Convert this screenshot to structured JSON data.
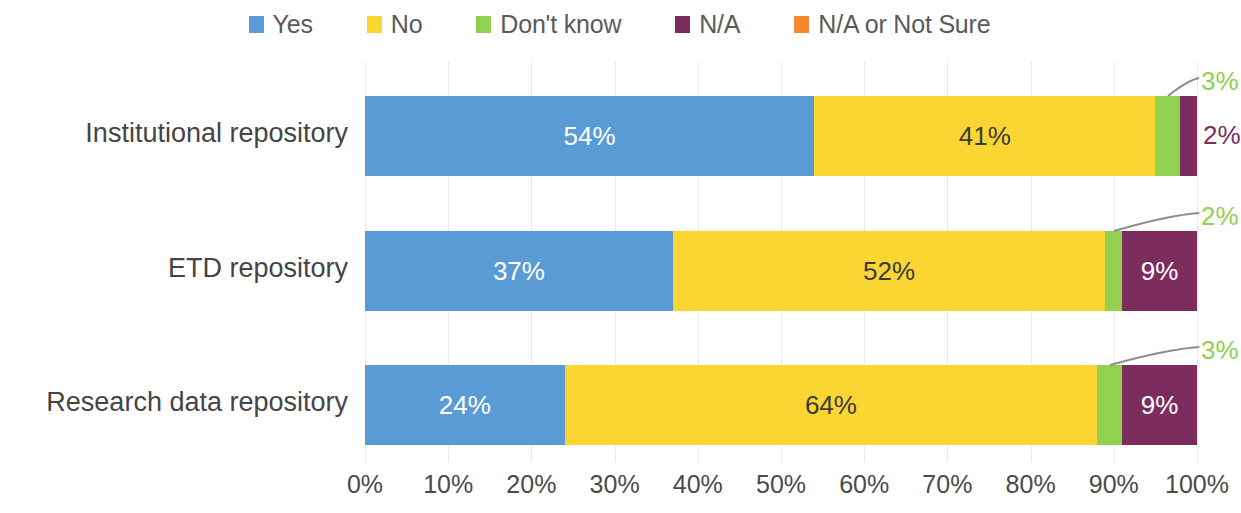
{
  "chart_data": {
    "type": "bar",
    "orientation": "horizontal",
    "stacked": true,
    "stack_mode": "percent",
    "title": "",
    "subtitle": "",
    "xlabel": "",
    "ylabel": "",
    "xlim": [
      0,
      100
    ],
    "xtick_labels": [
      "0%",
      "10%",
      "20%",
      "30%",
      "40%",
      "50%",
      "60%",
      "70%",
      "80%",
      "90%",
      "100%"
    ],
    "xtick_values": [
      0,
      10,
      20,
      30,
      40,
      50,
      60,
      70,
      80,
      90,
      100
    ],
    "grid": true,
    "grid_axis": "x",
    "legend_position": "top-center",
    "categories": [
      "Institutional repository",
      "ETD repository",
      "Research data repository"
    ],
    "series": [
      {
        "name": "Yes",
        "color": "#5b9bd5",
        "values": [
          54,
          37,
          24
        ],
        "labels": [
          "54%",
          "37%",
          "24%"
        ]
      },
      {
        "name": "No",
        "color": "#fbd531",
        "values": [
          41,
          52,
          64
        ],
        "labels": [
          "41%",
          "52%",
          "64%"
        ]
      },
      {
        "name": "Don't know",
        "color": "#92d050",
        "values": [
          3,
          2,
          3
        ],
        "labels": [
          "3%",
          "2%",
          "3%"
        ]
      },
      {
        "name": "N/A",
        "color": "#7c2d5e",
        "values": [
          2,
          9,
          9
        ],
        "labels": [
          "2%",
          "9%",
          "9%"
        ]
      },
      {
        "name": "N/A or Not Sure",
        "color": "#f5892f",
        "values": [
          0,
          0,
          0
        ],
        "labels": [
          "",
          "",
          ""
        ]
      }
    ],
    "annotations": [
      {
        "text": "3%",
        "series": "Don't know",
        "category": "Institutional repository",
        "style": "leader-line"
      },
      {
        "text": "2%",
        "series": "N/A",
        "category": "Institutional repository",
        "style": "outside-right"
      },
      {
        "text": "2%",
        "series": "Don't know",
        "category": "ETD repository",
        "style": "leader-line"
      },
      {
        "text": "3%",
        "series": "Don't know",
        "category": "Research data repository",
        "style": "leader-line"
      }
    ]
  },
  "legend": {
    "items": [
      {
        "label": "Yes",
        "color": "#5b9bd5"
      },
      {
        "label": "No",
        "color": "#fbd531"
      },
      {
        "label": "Don't know",
        "color": "#92d050"
      },
      {
        "label": "N/A",
        "color": "#7c2d5e"
      },
      {
        "label": "N/A or Not Sure",
        "color": "#f5892f"
      }
    ]
  },
  "axis": {
    "ticks": [
      "0%",
      "10%",
      "20%",
      "30%",
      "40%",
      "50%",
      "60%",
      "70%",
      "80%",
      "90%",
      "100%"
    ]
  },
  "rows": [
    {
      "category": "Institutional repository",
      "segments": [
        {
          "name": "Yes",
          "value": 54,
          "label": "54%",
          "label_color": "light",
          "label_inside": true
        },
        {
          "name": "No",
          "value": 41,
          "label": "41%",
          "label_color": "dark",
          "label_inside": true
        },
        {
          "name": "Don't know",
          "value": 3,
          "label": "3%",
          "label_color": "green",
          "label_inside": false
        },
        {
          "name": "N/A",
          "value": 2,
          "label": "2%",
          "label_color": "purple",
          "label_inside": false
        }
      ]
    },
    {
      "category": "ETD repository",
      "segments": [
        {
          "name": "Yes",
          "value": 37,
          "label": "37%",
          "label_color": "light",
          "label_inside": true
        },
        {
          "name": "No",
          "value": 52,
          "label": "52%",
          "label_color": "dark",
          "label_inside": true
        },
        {
          "name": "Don't know",
          "value": 2,
          "label": "2%",
          "label_color": "green",
          "label_inside": false
        },
        {
          "name": "N/A",
          "value": 9,
          "label": "9%",
          "label_color": "light",
          "label_inside": true
        }
      ]
    },
    {
      "category": "Research data repository",
      "segments": [
        {
          "name": "Yes",
          "value": 24,
          "label": "24%",
          "label_color": "light",
          "label_inside": true
        },
        {
          "name": "No",
          "value": 64,
          "label": "64%",
          "label_color": "dark",
          "label_inside": true
        },
        {
          "name": "Don't know",
          "value": 3,
          "label": "3%",
          "label_color": "green",
          "label_inside": false
        },
        {
          "name": "N/A",
          "value": 9,
          "label": "9%",
          "label_color": "light",
          "label_inside": true
        }
      ]
    }
  ],
  "colors": {
    "yes": "#5b9bd5",
    "no": "#fbd531",
    "dont_know": "#92d050",
    "na": "#7c2d5e",
    "na_or_not_sure": "#f5892f",
    "gridline": "#e8e8e8",
    "leader_line": "#8c8c8c",
    "axis_text": "#4a4a4a"
  }
}
